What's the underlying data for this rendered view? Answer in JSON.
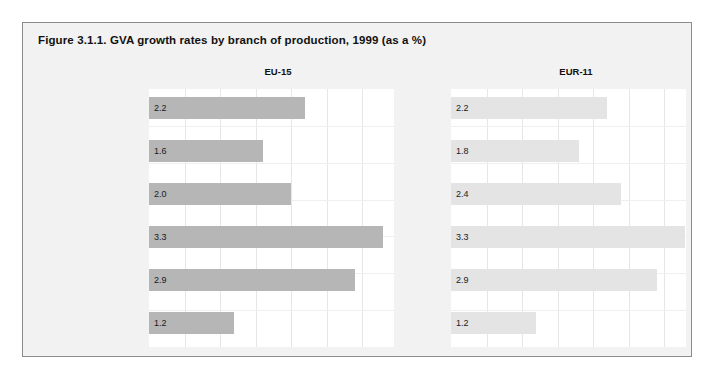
{
  "figure": {
    "title": "Figure 3.1.1. GVA growth rates by branch of production, 1999 (as a %)"
  },
  "panels": [
    {
      "key": "eu15",
      "header": "EU-15",
      "bar_color": "#b6b6b6"
    },
    {
      "key": "eur11",
      "header": "EUR-11",
      "bar_color": "#e4e4e4"
    }
  ],
  "categories": [
    "Agriculture",
    "Manufacturing",
    "Construction",
    "Trade, transport\nand communication",
    "Financial services\nand business activities",
    "Public services"
  ],
  "labels": {
    "eu15": [
      "2.2",
      "1.6",
      "2.0",
      "3.3",
      "2.9",
      "1.2"
    ],
    "eur11": [
      "2.2",
      "1.8",
      "2.4",
      "3.3",
      "2.9",
      "1.2"
    ]
  },
  "chart_data": {
    "type": "bar",
    "title": "Figure 3.1.1. GVA growth rates by branch of production, 1999 (as a %)",
    "orientation": "horizontal",
    "xlabel": "",
    "ylabel": "",
    "xlim": [
      0,
      3.5
    ],
    "grid": true,
    "legend": "none",
    "panel_titles": [
      "EU-15",
      "EUR-11"
    ],
    "categories": [
      "Agriculture",
      "Manufacturing",
      "Construction",
      "Trade, transport and communication",
      "Financial services and business activities",
      "Public services"
    ],
    "series": [
      {
        "name": "EU-15",
        "values": [
          2.2,
          1.6,
          2.0,
          3.3,
          2.9,
          1.2
        ]
      },
      {
        "name": "EUR-11",
        "values": [
          2.2,
          1.8,
          2.4,
          3.3,
          2.9,
          1.2
        ]
      }
    ],
    "data_labels": {
      "EU-15": [
        "2.2",
        "1.6",
        "2.0",
        "3.3",
        "2.9",
        "1.2"
      ],
      "EUR-11": [
        "2.2",
        "1.8",
        "2.4",
        "3.3",
        "2.9",
        "1.2"
      ]
    }
  }
}
